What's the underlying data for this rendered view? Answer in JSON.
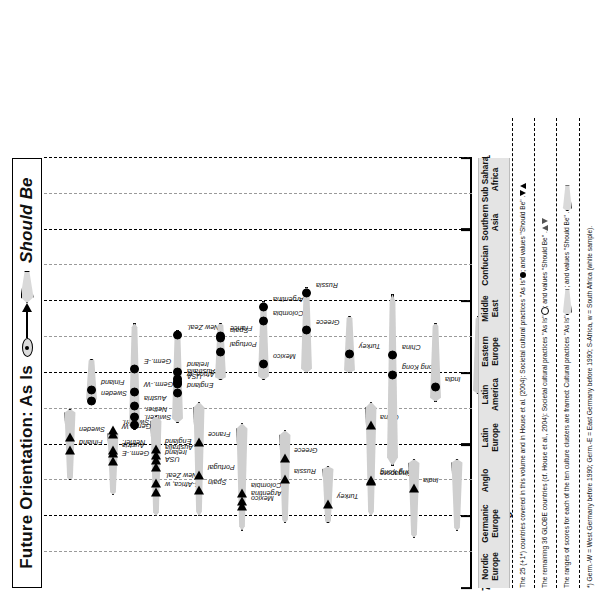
{
  "title": {
    "prefix": "Future Orientation: As Is",
    "suffix": "Should Be",
    "as_is_icon": "filled-circle-in-ellipse",
    "should_be_icon": "triangle-in-spear"
  },
  "axis": {
    "ticks": [
      "7",
      "6",
      "5",
      "4",
      "3",
      "2",
      "1"
    ],
    "bands": [
      {
        "label": "High",
        "value": 6
      },
      {
        "label": "Medium",
        "value": 4
      },
      {
        "label": "Low",
        "value": 2
      }
    ]
  },
  "clusters": [
    {
      "line1": "Nordic",
      "line2": "Europe"
    },
    {
      "line1": "Germanic",
      "line2": "Europe"
    },
    {
      "line1": "Anglo",
      "line2": ""
    },
    {
      "line1": "Latin",
      "line2": "Europe"
    },
    {
      "line1": "Latin",
      "line2": "America"
    },
    {
      "line1": "Eastern",
      "line2": "Europe"
    },
    {
      "line1": "Middle",
      "line2": "East"
    },
    {
      "line1": "Confucian",
      "line2": ""
    },
    {
      "line1": "Southern",
      "line2": "Asia"
    },
    {
      "line1": "Sub Sahara",
      "line2": "Africa"
    }
  ],
  "notes": [
    "The 25 (+1*) countries covered in this volume and in House et al. (2004): Societal cultural practices \"As Is\"  ; and values \"Should Be\"   .",
    "The remaining 36 GLOBE countries (cf. House et al., 2004): Societal cultural practices \"As Is\"  ; and values \"Should Be\"   .",
    "The ranges of scores for each of the ten culture clusters are framed: Cultural practices \"As Is\"              ; and values \"Should Be\"             .",
    "*) Germ.-W = West Germany before 1990; Germ.-E = East Germany before 1990; S-Africa, w = South Africa (white sample)."
  ],
  "chart_data": {
    "type": "scatter",
    "xlabel": "",
    "ylabel": "Score",
    "ylim": [
      1,
      7
    ],
    "grid": true,
    "orientation": "rotated-90",
    "legend_position": "title-inline",
    "series": [
      {
        "name": "Should Be (values)",
        "marker": "triangle",
        "cluster_band_fill": "#cfcfcf"
      },
      {
        "name": "As Is (practices)",
        "marker": "circle",
        "cluster_band_fill": "#cfcfcf"
      }
    ],
    "clusters": [
      {
        "cluster": "Nordic Europe",
        "should_be": {
          "range": [
            4.5,
            5.5
          ],
          "countries": [
            {
              "name": "Finland",
              "value": 5.07,
              "highlight": true
            },
            {
              "name": "Sweden",
              "value": 4.89,
              "highlight": true
            }
          ]
        },
        "as_is": {
          "range": [
            3.8,
            4.4
          ],
          "countries": [
            {
              "name": "Sweden",
              "value": 4.39,
              "highlight": true
            },
            {
              "name": "Finland",
              "value": 4.24,
              "highlight": true
            }
          ]
        }
      },
      {
        "cluster": "Germanic Europe",
        "should_be": {
          "range": [
            4.8,
            5.7
          ],
          "countries": [
            {
              "name": "Germ.-E",
              "value": 5.23,
              "highlight": true
            },
            {
              "name": "Austria",
              "value": 5.11,
              "highlight": true
            },
            {
              "name": "Nether.",
              "value": 5.07,
              "highlight": true
            },
            {
              "name": "Germ.-W",
              "value": 4.85,
              "highlight": true
            },
            {
              "name": "Switzerl.",
              "value": 4.79,
              "highlight": true
            }
          ]
        },
        "as_is": {
          "range": [
            3.3,
            4.8
          ],
          "countries": [
            {
              "name": "Switzerl.",
              "value": 4.73,
              "highlight": true
            },
            {
              "name": "Nether.",
              "value": 4.61,
              "highlight": true
            },
            {
              "name": "Austria",
              "value": 4.46,
              "highlight": true
            },
            {
              "name": "Germ.-W",
              "value": 4.27,
              "highlight": true
            },
            {
              "name": "Germ.-E",
              "value": 3.95,
              "highlight": true
            }
          ]
        }
      },
      {
        "cluster": "Anglo",
        "should_be": {
          "range": [
            4.6,
            6.0
          ],
          "countries": [
            {
              "name": "S-Africa, w",
              "value": 5.66,
              "highlight": true
            },
            {
              "name": "New Zeal.",
              "value": 5.54,
              "highlight": true
            },
            {
              "name": "USA",
              "value": 5.31,
              "highlight": true
            },
            {
              "name": "Ireland",
              "value": 5.22,
              "highlight": true
            },
            {
              "name": "Australia",
              "value": 5.15,
              "highlight": true
            },
            {
              "name": "England",
              "value": 5.06,
              "highlight": true
            }
          ]
        },
        "as_is": {
          "range": [
            3.4,
            4.7
          ],
          "countries": [
            {
              "name": "England",
              "value": 4.28,
              "highlight": true
            },
            {
              "name": "USA",
              "value": 4.15,
              "highlight": true
            },
            {
              "name": "S-Africa, w",
              "value": 4.13,
              "highlight": true
            },
            {
              "name": "Australia",
              "value": 4.09,
              "highlight": true
            },
            {
              "name": "Ireland",
              "value": 3.98,
              "highlight": true
            },
            {
              "name": "New Zeal.",
              "value": 3.47,
              "highlight": true
            }
          ]
        }
      },
      {
        "cluster": "Latin Europe",
        "should_be": {
          "range": [
            4.4,
            6.0
          ],
          "countries": [
            {
              "name": "Spain",
              "value": 5.63,
              "highlight": true
            },
            {
              "name": "Portugal",
              "value": 5.43,
              "highlight": true
            },
            {
              "name": "France",
              "value": 4.96,
              "highlight": true
            }
          ]
        },
        "as_is": {
          "range": [
            3.3,
            4.1
          ],
          "countries": [
            {
              "name": "Portugal",
              "value": 3.71,
              "highlight": true
            },
            {
              "name": "Spain",
              "value": 3.51,
              "highlight": true
            },
            {
              "name": "France",
              "value": 3.48,
              "highlight": true
            }
          ]
        }
      },
      {
        "cluster": "Latin America",
        "should_be": {
          "range": [
            4.7,
            6.2
          ],
          "countries": [
            {
              "name": "Mexico",
              "value": 5.86,
              "highlight": true
            },
            {
              "name": "Argentina",
              "value": 5.78,
              "highlight": true
            },
            {
              "name": "Colombia",
              "value": 5.68,
              "highlight": true
            }
          ]
        },
        "as_is": {
          "range": [
            3.0,
            4.1
          ],
          "countries": [
            {
              "name": "Mexico",
              "value": 3.87,
              "highlight": true
            },
            {
              "name": "Colombia",
              "value": 3.27,
              "highlight": true
            },
            {
              "name": "Argentina",
              "value": 3.08,
              "highlight": true
            }
          ]
        }
      },
      {
        "cluster": "Eastern Europe",
        "should_be": {
          "range": [
            4.8,
            6.1
          ],
          "countries": [
            {
              "name": "Russia",
              "value": 5.48,
              "highlight": true
            },
            {
              "name": "Greece",
              "value": 5.19,
              "highlight": true
            }
          ]
        },
        "as_is": {
          "range": [
            2.8,
            4.0
          ],
          "countries": [
            {
              "name": "Greece",
              "value": 3.4,
              "highlight": true
            },
            {
              "name": "Russia",
              "value": 2.88,
              "highlight": true
            }
          ]
        }
      },
      {
        "cluster": "Middle East",
        "should_be": {
          "range": [
            5.3,
            6.1
          ],
          "countries": [
            {
              "name": "Turkey",
              "value": 5.83,
              "highlight": true
            }
          ]
        },
        "as_is": {
          "range": [
            3.2,
            4.0
          ],
          "countries": [
            {
              "name": "Turkey",
              "value": 3.74,
              "highlight": true
            }
          ]
        }
      },
      {
        "cluster": "Confucian",
        "should_be": {
          "range": [
            4.4,
            6.0
          ],
          "countries": [
            {
              "name": "Singapore",
              "value": 5.51,
              "highlight": true
            },
            {
              "name": "Hong Kong",
              "value": 5.5,
              "highlight": true
            },
            {
              "name": "China",
              "value": 4.73,
              "highlight": true
            }
          ]
        },
        "as_is": {
          "range": [
            2.9,
            5.3
          ],
          "countries": [
            {
              "name": "Hong Kong",
              "value": 4.03,
              "highlight": true
            },
            {
              "name": "China",
              "value": 3.75,
              "highlight": true
            }
          ]
        }
      },
      {
        "cluster": "Southern Asia",
        "should_be": {
          "range": [
            5.2,
            6.3
          ],
          "countries": [
            {
              "name": "India",
              "value": 5.6,
              "highlight": true
            }
          ]
        },
        "as_is": {
          "range": [
            3.3,
            4.4
          ],
          "countries": [
            {
              "name": "India",
              "value": 4.19,
              "highlight": true
            }
          ]
        }
      },
      {
        "cluster": "Sub Sahara Africa",
        "should_be": {
          "range": [
            5.2,
            6.2
          ],
          "countries": []
        },
        "as_is": {
          "range": [
            3.2,
            4.3
          ],
          "countries": []
        }
      }
    ]
  }
}
